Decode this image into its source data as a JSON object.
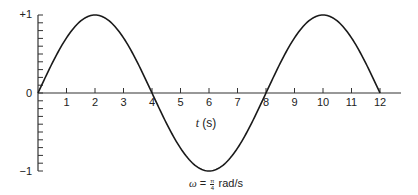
{
  "chart_data": {
    "type": "line",
    "title": "",
    "xlabel": "t (s)",
    "ylabel": "",
    "annotation": "ω = π/4 rad/s",
    "xlim": [
      0,
      12
    ],
    "ylim": [
      -1,
      1
    ],
    "x_ticks": [
      1,
      2,
      3,
      4,
      5,
      6,
      7,
      8,
      9,
      10,
      11,
      12
    ],
    "y_tick_labels": [
      "+1",
      "0",
      "−1"
    ],
    "y_minor_ticks_per_unit": 10,
    "grid": false,
    "legend": null,
    "series": [
      {
        "name": "sin(ωt)",
        "function": "sin(pi/4 * t)",
        "x": [
          0,
          1,
          2,
          3,
          4,
          5,
          6,
          7,
          8,
          9,
          10,
          11,
          12
        ],
        "values": [
          0,
          0.707,
          1,
          0.707,
          0,
          -0.707,
          -1,
          -0.707,
          0,
          0.707,
          1,
          0.707,
          0
        ]
      }
    ]
  },
  "labels": {
    "y_top": "+1",
    "y_zero": "0",
    "y_bottom": "−1",
    "x_axis_var": "t",
    "x_axis_unit": "(s)",
    "omega_symbol": "ω",
    "equals": "=",
    "frac_num": "π",
    "frac_den": "4",
    "omega_unit": "rad/s"
  },
  "colors": {
    "curve": "#1a1a1a",
    "axis": "#333333"
  }
}
